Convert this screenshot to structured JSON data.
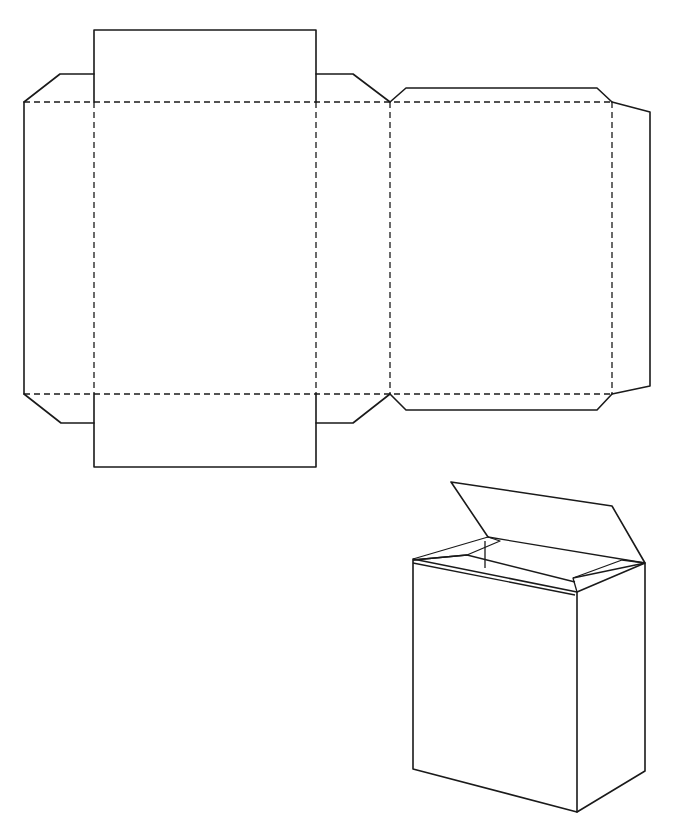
{
  "diagram": {
    "title": "Box template (net) and assembled box",
    "colors": {
      "line": "#1a1a1a",
      "background": "#ffffff"
    },
    "net": {
      "label": "Unfolded box net",
      "fold_lines": {
        "horizontal_y": [
          102,
          394
        ],
        "vertical_x": [
          94,
          316,
          390,
          612
        ],
        "x_range": [
          24,
          612
        ]
      },
      "panels": [
        {
          "name": "left-side-panel",
          "x": [
            24,
            94
          ],
          "y": [
            102,
            394
          ]
        },
        {
          "name": "front-panel",
          "x": [
            94,
            316
          ],
          "y": [
            102,
            394
          ]
        },
        {
          "name": "right-side-panel",
          "x": [
            316,
            390
          ],
          "y": [
            102,
            394
          ]
        },
        {
          "name": "back-panel",
          "x": [
            390,
            612
          ],
          "y": [
            102,
            394
          ]
        }
      ],
      "flaps": [
        {
          "name": "top-main-flap",
          "points": "94,102 94,30 316,30 316,102"
        },
        {
          "name": "top-left-dust-flap",
          "points": "24,102 60,74 94,74"
        },
        {
          "name": "top-right-dust-flap",
          "points": "316,74 353,74 390,102"
        },
        {
          "name": "top-back-flap",
          "points": "390,102 406,88 597,88 612,102"
        },
        {
          "name": "glue-tab",
          "points": "612,102 650,112 650,386 612,394"
        },
        {
          "name": "bottom-main-flap",
          "points": "94,394 94,467 316,467 316,394"
        },
        {
          "name": "bottom-left-dust-flap",
          "points": "24,394 61,423 94,423"
        },
        {
          "name": "bottom-right-dust-flap",
          "points": "316,423 353,423 390,394"
        },
        {
          "name": "bottom-back-flap",
          "points": "390,394 406,410 597,410 612,394"
        }
      ]
    },
    "assembled_box": {
      "label": "Assembled box with open lid",
      "front_face": "413,559 577,592 577,812 413,769",
      "side_face": "577,592 645,563 645,771 577,812",
      "lid": "451,482 612,506 645,563",
      "lid_hinge": "488,537 645,563",
      "left_tuck_flap": "413,559 488,537 500,541 467,555 413,559",
      "right_tuck_flap": "577,592 573,577 622,560 645,563",
      "inner_edges": [
        "413,559 577,592",
        "413,559 467,555 575,582",
        "485,541 485,567",
        "413,563 575,595"
      ]
    }
  }
}
